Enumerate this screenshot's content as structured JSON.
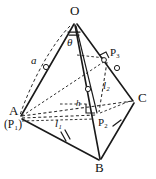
{
  "figure": {
    "width": 156,
    "height": 179,
    "background": "#ffffff",
    "ink_color": "#111111"
  },
  "vertices": [
    {
      "id": "O",
      "label": "O",
      "x": 75,
      "y": 22,
      "label_x": 70,
      "label_y": 5
    },
    {
      "id": "A",
      "label": "A",
      "x": 20,
      "y": 117,
      "label_x": 10,
      "label_y": 106
    },
    {
      "id": "B",
      "label": "B",
      "x": 100,
      "y": 161,
      "label_x": 96,
      "label_y": 163
    },
    {
      "id": "C",
      "label": "C",
      "x": 134,
      "y": 101,
      "label_x": 139,
      "label_y": 92
    }
  ],
  "points": [
    {
      "id": "P1",
      "label": "(P₁)",
      "base": "P",
      "sub": "1",
      "x": 20,
      "y": 117,
      "label_x": 6,
      "label_y": 120
    },
    {
      "id": "P2",
      "label": "P₂",
      "base": "P",
      "sub": "2",
      "x": 98,
      "y": 116,
      "label_x": 99,
      "label_y": 118
    },
    {
      "id": "P3",
      "label": "P₃",
      "base": "P",
      "sub": "3",
      "x": 107,
      "y": 60,
      "label_x": 111,
      "label_y": 48
    }
  ],
  "measures": [
    {
      "id": "a",
      "label": "a",
      "base": "a",
      "sub": "",
      "x": 33,
      "y": 60,
      "desc": "edge-length-a-on-OA"
    },
    {
      "id": "h",
      "label": "h",
      "base": "h",
      "sub": "",
      "x": 78,
      "y": 103,
      "desc": "height-h-horizontal"
    },
    {
      "id": "l1",
      "label": "l₁",
      "base": "l",
      "sub": "1",
      "x": 57,
      "y": 122,
      "desc": "length-l1-A-to-P2"
    },
    {
      "id": "l2",
      "label": "l₂",
      "base": "l",
      "sub": "2",
      "x": 105,
      "y": 85,
      "desc": "length-l2-P2-to-P3"
    },
    {
      "id": "theta",
      "label": "θ",
      "base": "θ",
      "sub": "",
      "x": 68,
      "y": 38,
      "desc": "angle-theta-at-O"
    }
  ],
  "edges": [
    {
      "id": "OA",
      "from": "O",
      "to": "A",
      "style": "solid"
    },
    {
      "id": "OB",
      "from": "O",
      "to": "B",
      "style": "solid"
    },
    {
      "id": "OC",
      "from": "O",
      "to": "C",
      "style": "solid"
    },
    {
      "id": "AB",
      "from": "A",
      "to": "B",
      "style": "solid"
    },
    {
      "id": "BC",
      "from": "B",
      "to": "C",
      "style": "solid"
    },
    {
      "id": "AC",
      "from": "A",
      "to": "C",
      "style": "dashed"
    }
  ],
  "construction_lines": [
    {
      "id": "A-P2",
      "style": "dashed",
      "desc": "l1-from-A-to-P2"
    },
    {
      "id": "P2-P3",
      "style": "dashed",
      "desc": "l2-from-P2-to-P3"
    },
    {
      "id": "A-P3",
      "style": "dashed",
      "desc": "A-to-P3"
    },
    {
      "id": "O-P2",
      "style": "solid",
      "desc": "altitude-O-to-P2"
    },
    {
      "id": "h-line",
      "style": "dashed",
      "desc": "horizontal-h-line-to-P2"
    },
    {
      "id": "arc-a",
      "style": "dashed",
      "desc": "arc-radius-a-from-O-to-A"
    }
  ],
  "tick_marks": [
    {
      "id": "tick-OA",
      "desc": "circle-tick-on-OA"
    },
    {
      "id": "tick-OB",
      "desc": "circle-tick-on-OB"
    },
    {
      "id": "tick-OC",
      "desc": "circle-tick-on-OC"
    },
    {
      "id": "tick-AB",
      "desc": "double-hash-on-AB"
    },
    {
      "id": "tick-BC",
      "desc": "single-hash-on-BC"
    }
  ],
  "right_angles": [
    {
      "id": "ra-P2",
      "desc": "right-angle-at-P2"
    },
    {
      "id": "ra-P3",
      "desc": "right-angle-at-P3"
    },
    {
      "id": "ra-O",
      "desc": "angle-arc-at-O-for-theta"
    }
  ]
}
